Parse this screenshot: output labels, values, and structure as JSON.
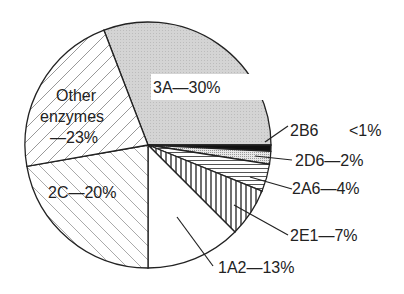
{
  "chart_data": {
    "type": "pie",
    "title": "",
    "categories": [
      "3A",
      "2B6",
      "2D6",
      "2A6",
      "2E1",
      "1A2",
      "2C",
      "Other enzymes"
    ],
    "values": [
      30,
      0.7,
      2,
      4,
      7,
      13,
      20,
      23
    ],
    "labels": {
      "3A": "3A—30%",
      "2B6_name": "2B6",
      "2B6_value": "<1%",
      "2D6": "2D6—2%",
      "2A6": "2A6—4%",
      "2E1": "2E1—7%",
      "1A2": "1A2—13%",
      "2C": "2C—20%",
      "other_line1": "Other",
      "other_line2": "enzymes",
      "other_line3": "—23%"
    },
    "fills": {
      "3A": "dotted light gray",
      "2B6": "solid black",
      "2D6": "fine dotted gray",
      "2A6": "horizontal lines",
      "2E1": "vertical lines",
      "1A2": "white",
      "2C": "light diagonal hatch (\\)",
      "Other enzymes": "diagonal hatch (/)"
    },
    "legend": "none (direct labels with leader lines)"
  }
}
